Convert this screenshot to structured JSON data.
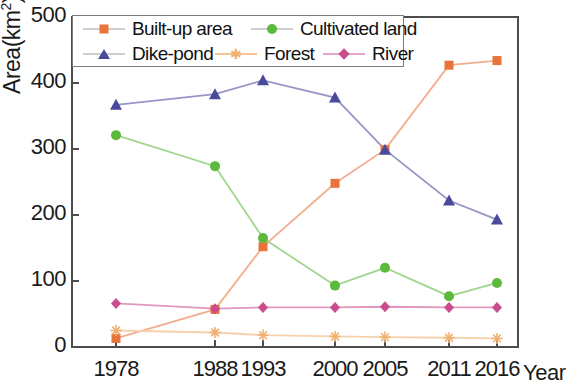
{
  "chart_data": {
    "type": "line",
    "title": "",
    "xlabel": "Year",
    "ylabel": "Area(km2)",
    "ylabel_base": "Area(km",
    "ylabel_sup": "2",
    "ylabel_tail": ")",
    "categories": [
      "1978",
      "1988",
      "1993",
      "2000",
      "2005",
      "2011",
      "2016"
    ],
    "ylim": [
      0,
      500
    ],
    "yticks": [
      0,
      100,
      200,
      300,
      400,
      500
    ],
    "ytick_labels": [
      "0",
      "100",
      "200",
      "300",
      "400",
      "500"
    ],
    "grid": false,
    "legend_position": "top-left",
    "series": [
      {
        "name": "Built-up area",
        "color": "#E8743B",
        "marker": "square",
        "values": [
          13,
          57,
          152,
          248,
          299,
          427,
          434
        ]
      },
      {
        "name": "Cultivated land",
        "color": "#5BB93C",
        "marker": "circle",
        "values": [
          321,
          274,
          165,
          93,
          120,
          77,
          97
        ]
      },
      {
        "name": "Dike-pond",
        "color": "#4A4A9C",
        "marker": "triangle",
        "values": [
          367,
          383,
          404,
          378,
          299,
          222,
          193
        ]
      },
      {
        "name": "Forest",
        "color": "#F0B070",
        "marker": "star",
        "values": [
          25,
          22,
          18,
          16,
          15,
          14,
          13
        ]
      },
      {
        "name": "River",
        "color": "#C94C8C",
        "marker": "diamond",
        "values": [
          66,
          58,
          60,
          60,
          61,
          60,
          60
        ]
      }
    ]
  },
  "legend": {
    "items": [
      {
        "label": "Built-up area"
      },
      {
        "label": "Cultivated land"
      },
      {
        "label": "Dike-pond"
      },
      {
        "label": "Forest"
      },
      {
        "label": "River"
      }
    ]
  }
}
